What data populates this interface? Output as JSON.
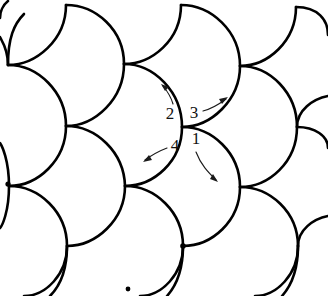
{
  "figure": {
    "background_color": "#ffffff",
    "curve_color": "#000000",
    "annotation_color": "#1a1a1a",
    "curve_stroke_width": 2.6,
    "width": 328,
    "height": 296
  },
  "lattice": {
    "description": "Crossing nodes of the curved tiling",
    "spacing_x": 115,
    "row_offset_x": -58,
    "row_offset_y": 60,
    "center_node": {
      "x": 182,
      "y": 127
    },
    "nodes": [
      {
        "x": 66,
        "y": 5
      },
      {
        "x": 181,
        "y": 5
      },
      {
        "x": 296,
        "y": 7
      },
      {
        "x": 8,
        "y": 65
      },
      {
        "x": 124,
        "y": 64
      },
      {
        "x": 240,
        "y": 66
      },
      {
        "x": 66,
        "y": 126
      },
      {
        "x": 182,
        "y": 127
      },
      {
        "x": 297,
        "y": 127
      },
      {
        "x": 9,
        "y": 186
      },
      {
        "x": 125,
        "y": 186
      },
      {
        "x": 240,
        "y": 187
      },
      {
        "x": 67,
        "y": 246
      },
      {
        "x": 183,
        "y": 246
      },
      {
        "x": 298,
        "y": 246
      }
    ],
    "marked_nodes": [
      {
        "x": 8,
        "y": 184
      },
      {
        "x": 183,
        "y": 246
      },
      {
        "x": 128,
        "y": 289
      }
    ]
  },
  "annotations": {
    "center_label": "",
    "markers": [
      {
        "id": "marker-1",
        "label": "1",
        "label_x": 196,
        "label_y": 140,
        "direction": "down-right",
        "arrow_path": "M 196 152 C 201 165, 208 172, 216 180",
        "head_x": 218,
        "head_y": 182,
        "head_angle": 47
      },
      {
        "id": "marker-2",
        "label": "2",
        "label_x": 170,
        "label_y": 115,
        "direction": "up-left",
        "arrow_path": "M 173 104 C 171 97, 168 92, 163 86",
        "head_x": 161,
        "head_y": 84,
        "head_angle": 228
      },
      {
        "id": "marker-3",
        "label": "3",
        "label_x": 194,
        "label_y": 114,
        "direction": "up-right",
        "arrow_path": "M 203 111 C 211 109, 218 105, 226 99",
        "head_x": 228,
        "head_y": 97,
        "head_angle": 323
      },
      {
        "id": "marker-4",
        "label": "4",
        "label_x": 175,
        "label_y": 147,
        "direction": "down-left",
        "arrow_path": "M 167 148 C 159 151, 152 155, 145 160",
        "head_x": 143,
        "head_y": 162,
        "head_angle": 145
      }
    ]
  }
}
